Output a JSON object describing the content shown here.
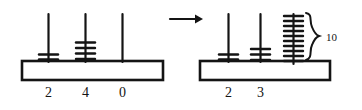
{
  "figure": {
    "ink_color": "#141414",
    "background_color": "#ffffff",
    "arrow": {
      "name": "right-arrow",
      "glyph": "→"
    },
    "abacuses": [
      {
        "id": "left-abacus",
        "rods": [
          {
            "label": "2",
            "beads": 2
          },
          {
            "label": "4",
            "beads": 4
          },
          {
            "label": "0",
            "beads": 0
          }
        ]
      },
      {
        "id": "right-abacus",
        "rods": [
          {
            "label": "2",
            "beads": 2
          },
          {
            "label": "3",
            "beads": 3
          },
          {
            "label": "",
            "beads": 10
          }
        ],
        "annotation": {
          "name": "brace-count",
          "text": "10",
          "applies_to_rod": 3
        }
      }
    ]
  }
}
